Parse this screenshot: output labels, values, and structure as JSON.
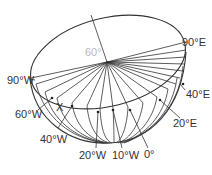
{
  "diagram": {
    "type": "hemisphere-meridians",
    "center_label": "60°",
    "point_label": "X",
    "labels": {
      "e90": "90°E",
      "e40": "40°E",
      "e20": "20°E",
      "zero": "0°",
      "w10": "10°W",
      "w20": "20°W",
      "w40": "40°W",
      "w60": "60°W",
      "w90": "90°W"
    },
    "colors": {
      "line": "#333333",
      "center_label": "#bbbbbb"
    }
  }
}
